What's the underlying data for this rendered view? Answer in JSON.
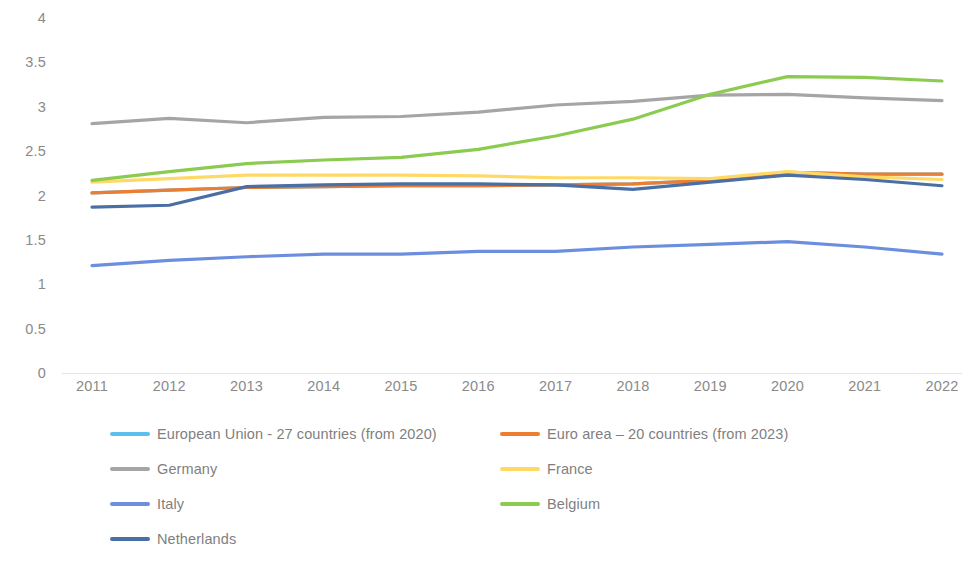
{
  "chart_data": {
    "type": "line",
    "title": "",
    "subtitle": "",
    "xlabel": "",
    "ylabel": "",
    "x": [
      2011,
      2012,
      2013,
      2014,
      2015,
      2016,
      2017,
      2018,
      2019,
      2020,
      2021,
      2022
    ],
    "xtick_labels": [
      "2011",
      "2012",
      "2013",
      "2014",
      "2015",
      "2016",
      "2017",
      "2018",
      "2019",
      "2020",
      "2021",
      "2022"
    ],
    "ytick_labels": [
      "0",
      "0.5",
      "1",
      "1.5",
      "2",
      "2.5",
      "3",
      "3.5",
      "4"
    ],
    "ytick_values": [
      0,
      0.5,
      1,
      1.5,
      2,
      2.5,
      3,
      3.5,
      4
    ],
    "ylim": [
      0,
      4
    ],
    "grid": false,
    "legend_position": "bottom",
    "series": [
      {
        "name": "European Union - 27 countries (from 2020)",
        "color": "#5BC0EB",
        "values": [
          2.03,
          2.06,
          2.09,
          2.1,
          2.11,
          2.11,
          2.12,
          2.13,
          2.17,
          2.26,
          2.24,
          2.24
        ]
      },
      {
        "name": "Euro area – 20 countries (from 2023)",
        "color": "#ED7D31",
        "values": [
          2.03,
          2.06,
          2.09,
          2.1,
          2.11,
          2.11,
          2.12,
          2.13,
          2.17,
          2.26,
          2.24,
          2.24
        ]
      },
      {
        "name": "Germany",
        "color": "#A5A5A5",
        "values": [
          2.81,
          2.87,
          2.82,
          2.88,
          2.89,
          2.94,
          3.02,
          3.06,
          3.13,
          3.14,
          3.1,
          3.07
        ]
      },
      {
        "name": "France",
        "color": "#FFD966",
        "values": [
          2.15,
          2.19,
          2.23,
          2.23,
          2.23,
          2.22,
          2.2,
          2.2,
          2.19,
          2.27,
          2.21,
          2.18
        ]
      },
      {
        "name": "Italy",
        "color": "#6B8FDE",
        "values": [
          1.21,
          1.27,
          1.31,
          1.34,
          1.34,
          1.37,
          1.37,
          1.42,
          1.45,
          1.48,
          1.42,
          1.34
        ]
      },
      {
        "name": "Belgium",
        "color": "#8BCB51",
        "values": [
          2.17,
          2.27,
          2.36,
          2.4,
          2.43,
          2.52,
          2.67,
          2.86,
          3.14,
          3.34,
          3.33,
          3.29
        ]
      },
      {
        "name": "Netherlands",
        "color": "#4A6FA5",
        "values": [
          1.87,
          1.89,
          2.1,
          2.12,
          2.13,
          2.13,
          2.12,
          2.07,
          2.15,
          2.23,
          2.18,
          2.11
        ]
      }
    ]
  },
  "legend": {
    "items": [
      {
        "label": "European Union - 27 countries (from 2020)",
        "color": "#5BC0EB",
        "col": 0,
        "row": 0
      },
      {
        "label": "Euro area – 20 countries (from 2023)",
        "color": "#ED7D31",
        "col": 1,
        "row": 0
      },
      {
        "label": "Germany",
        "color": "#A5A5A5",
        "col": 0,
        "row": 1
      },
      {
        "label": "France",
        "color": "#FFD966",
        "col": 1,
        "row": 1
      },
      {
        "label": "Italy",
        "color": "#6B8FDE",
        "col": 0,
        "row": 2
      },
      {
        "label": "Belgium",
        "color": "#8BCB51",
        "col": 1,
        "row": 2
      },
      {
        "label": "Netherlands",
        "color": "#4A6FA5",
        "col": 0,
        "row": 3
      }
    ]
  },
  "colors": {
    "axis_text": "#8a8a8a",
    "legend_text": "#7f7f7f",
    "background": "#ffffff",
    "axis_line": "#e4e4e4"
  }
}
